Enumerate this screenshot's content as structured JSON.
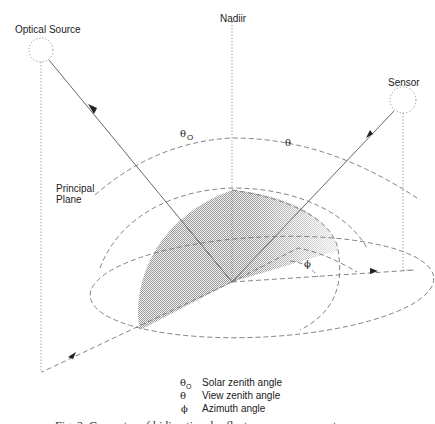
{
  "figure": {
    "labels": {
      "source": "Optical Source",
      "sensor": "Sensor",
      "nadir": "Nadiir",
      "plane_line1": "Principal",
      "plane_line2": "Plane",
      "theta_o": "θ",
      "theta_o_sub": "O",
      "theta": "θ",
      "phi": "ϕ"
    },
    "legend": [
      {
        "symbol": "θ",
        "sub": "O",
        "text": "Solar zenith angle"
      },
      {
        "symbol": "θ",
        "sub": "",
        "text": "View  zenith angle"
      },
      {
        "symbol": "ϕ",
        "sub": "",
        "text": "Azimuth angle"
      }
    ],
    "caption": "Fig. 2. Geometry of bidirectional reflectance measurements"
  }
}
